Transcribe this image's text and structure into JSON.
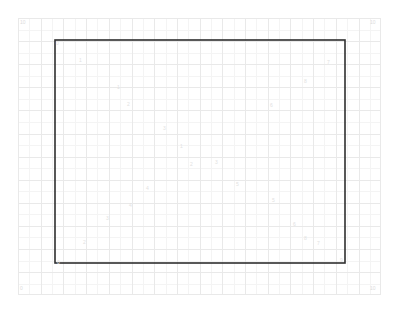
{
  "figure": {
    "title": "",
    "width": 399,
    "height": 313,
    "background_color": "#ffffff"
  },
  "plot_area": {
    "left": 18,
    "top": 18,
    "width": 363,
    "height": 277
  },
  "grid": {
    "major_color": "#e9e9e9",
    "minor_color": "#f4f4f4",
    "major_line_width": 1,
    "minor_line_width": 1,
    "columns": 16,
    "rows": 12,
    "cell_width": 22.7,
    "cell_height": 23.1,
    "visible": true
  },
  "rectangle": {
    "stroke_color": "#2f2f2f",
    "stroke_width": 1.6,
    "fill": "none",
    "x": 55,
    "y": 40,
    "width": 290,
    "height": 223
  },
  "corner_labels": [
    {
      "text": "10",
      "x": 20,
      "y": 20,
      "corner": "top-left"
    },
    {
      "text": "10",
      "x": 370,
      "y": 20,
      "corner": "top-right"
    },
    {
      "text": "0",
      "x": 20,
      "y": 286,
      "corner": "bottom-left"
    },
    {
      "text": "10",
      "x": 370,
      "y": 286,
      "corner": "bottom-right"
    }
  ],
  "faint_labels": [
    {
      "text": "0",
      "x": 56,
      "y": 41
    },
    {
      "text": "1",
      "x": 79,
      "y": 58
    },
    {
      "text": "8",
      "x": 304,
      "y": 79
    },
    {
      "text": "7",
      "x": 327,
      "y": 60
    },
    {
      "text": "1",
      "x": 117,
      "y": 85
    },
    {
      "text": "2",
      "x": 127,
      "y": 102
    },
    {
      "text": "6",
      "x": 270,
      "y": 103
    },
    {
      "text": "3",
      "x": 163,
      "y": 126
    },
    {
      "text": "1",
      "x": 180,
      "y": 144
    },
    {
      "text": "3",
      "x": 215,
      "y": 160
    },
    {
      "text": "2",
      "x": 190,
      "y": 162
    },
    {
      "text": "5",
      "x": 236,
      "y": 182
    },
    {
      "text": "4",
      "x": 146,
      "y": 186
    },
    {
      "text": "5",
      "x": 272,
      "y": 198
    },
    {
      "text": "4",
      "x": 129,
      "y": 203
    },
    {
      "text": "3",
      "x": 106,
      "y": 216
    },
    {
      "text": "6",
      "x": 293,
      "y": 222
    },
    {
      "text": "2",
      "x": 83,
      "y": 240
    },
    {
      "text": "7",
      "x": 317,
      "y": 241
    },
    {
      "text": "8",
      "x": 304,
      "y": 236
    },
    {
      "text": "0",
      "x": 57,
      "y": 260
    },
    {
      "text": "9",
      "x": 340,
      "y": 258
    }
  ],
  "chart_data": {
    "type": "line",
    "title": "",
    "subtitle": "",
    "xlabel": "",
    "ylabel": "",
    "xlim": [
      0,
      16
    ],
    "ylim": [
      0,
      12
    ],
    "grid": true,
    "legend": null,
    "legend_position": "none",
    "xticklabels": [],
    "yticklabels": [],
    "annotations": [
      "10",
      "10",
      "0",
      "10",
      "0",
      "1",
      "8",
      "7",
      "1",
      "2",
      "6",
      "3",
      "1",
      "3",
      "2",
      "5",
      "4",
      "5",
      "4",
      "3",
      "6",
      "2",
      "7",
      "8",
      "0",
      "9"
    ],
    "series": [
      {
        "name": "rectangle-outline",
        "type": "closed-path",
        "color": "#2f2f2f",
        "linewidth": 1.6,
        "fill": "none",
        "x": [
          55,
          345,
          345,
          55,
          55
        ],
        "y": [
          40,
          40,
          263,
          263,
          40
        ]
      }
    ]
  }
}
